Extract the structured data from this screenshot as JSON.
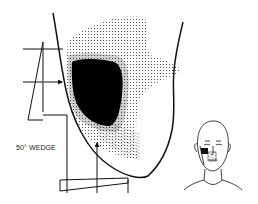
{
  "figure": {
    "wedge_label": "50° WEDGE"
  },
  "colors": {
    "ink": "#111111",
    "background": "#ffffff",
    "high_dose": "#000000",
    "dot_stipple": "#333333"
  }
}
